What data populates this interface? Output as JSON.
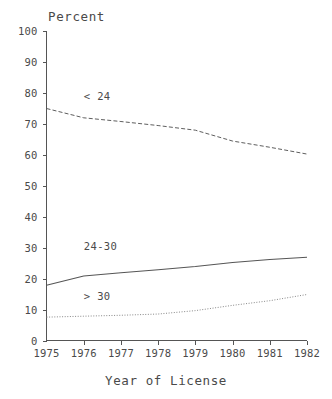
{
  "chart_data": {
    "type": "line",
    "title": "",
    "ylabel": "Percent",
    "xlabel": "Year of License",
    "x": [
      1975,
      1976,
      1977,
      1978,
      1979,
      1980,
      1981,
      1982
    ],
    "xtick_labels": [
      "1975",
      "1976",
      "1977",
      "1978",
      "1979",
      "1980",
      "1981",
      "1982"
    ],
    "ytick_labels": [
      "0",
      "10",
      "20",
      "30",
      "40",
      "50",
      "60",
      "70",
      "80",
      "90",
      "100"
    ],
    "ytick_values": [
      0,
      10,
      20,
      30,
      40,
      50,
      60,
      70,
      80,
      90,
      100
    ],
    "ylim": [
      0,
      100
    ],
    "xlim": [
      1975,
      1982
    ],
    "grid": false,
    "legend_position": "inline-annotations",
    "series": [
      {
        "name": "< 24",
        "style": "dashed",
        "color": "#555555",
        "values": [
          75.0,
          72.0,
          70.8,
          69.5,
          68.0,
          64.5,
          62.5,
          60.3
        ],
        "annotation": "< 24",
        "annotation_x": 1976.0,
        "annotation_y": 79.0
      },
      {
        "name": "24-30",
        "style": "solid",
        "color": "#555555",
        "values": [
          18.0,
          21.0,
          22.0,
          23.0,
          24.0,
          25.3,
          26.3,
          27.0
        ],
        "annotation": "24-30",
        "annotation_x": 1976.0,
        "annotation_y": 30.5
      },
      {
        "name": "> 30",
        "style": "dotted",
        "color": "#888888",
        "values": [
          7.7,
          8.0,
          8.3,
          8.7,
          9.8,
          11.5,
          13.0,
          15.0
        ],
        "annotation": "> 30",
        "annotation_x": 1976.0,
        "annotation_y": 14.5
      }
    ]
  },
  "axes": {
    "y_title": "Percent",
    "x_title": "Year of License"
  },
  "colors": {
    "axis": "#555555",
    "text": "#4a4a4a",
    "background": "#ffffff",
    "series_dark": "#555555",
    "series_light": "#888888"
  }
}
